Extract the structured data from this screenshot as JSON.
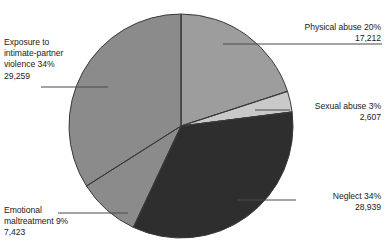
{
  "chart_data": {
    "type": "pie",
    "title": "",
    "subtitle": "",
    "xlabel": "",
    "ylabel": "",
    "legend_position": "callout-labels",
    "grid": false,
    "total": 85440,
    "start_angle_deg": 0,
    "direction": "clockwise",
    "categories": [
      "Physical abuse",
      "Sexual abuse",
      "Neglect",
      "Emotional maltreatment",
      "Exposure to intimate-partner violence"
    ],
    "values": [
      17212,
      2607,
      28939,
      7423,
      29259
    ],
    "percents": [
      20,
      3,
      34,
      9,
      34
    ],
    "colors": [
      "#9d9d9d",
      "#c9c9c9",
      "#2e2e2e",
      "#8b8b8b",
      "#8b8b8b"
    ],
    "slices": [
      {
        "label": "Physical abuse",
        "percent": 20,
        "percent_text": "20%",
        "value": 17212,
        "value_text": "17,212",
        "color": "#9d9d9d",
        "start_deg": 0,
        "sweep_deg": 72
      },
      {
        "label": "Sexual abuse",
        "percent": 3,
        "percent_text": "3%",
        "value": 2607,
        "value_text": "2,607",
        "color": "#c9c9c9",
        "start_deg": 72,
        "sweep_deg": 10.8
      },
      {
        "label": "Neglect",
        "percent": 34,
        "percent_text": "34%",
        "value": 28939,
        "value_text": "28,939",
        "color": "#2e2e2e",
        "start_deg": 82.8,
        "sweep_deg": 122.4
      },
      {
        "label": "Emotional maltreatment",
        "percent": 9,
        "percent_text": "9%",
        "value": 7423,
        "value_text": "7,423",
        "color": "#8b8b8b",
        "start_deg": 205.2,
        "sweep_deg": 32.4
      },
      {
        "label": "Exposure to intimate-partner violence",
        "percent": 34,
        "percent_text": "34%",
        "value": 29259,
        "value_text": "29,259",
        "color": "#8b8b8b",
        "start_deg": 237.6,
        "sweep_deg": 122.4
      }
    ]
  },
  "labels": {
    "physical": "Physical abuse 20%\n17,212",
    "sexual": "Sexual abuse 3%\n2,607",
    "neglect": "Neglect 34%\n28,939",
    "emotional": "Emotional\nmaltreatment 9%\n7,423",
    "exposure": "Exposure to\nintimate-partner\nviolence 34%\n29,259"
  },
  "style": {
    "background": "#ffffff",
    "text_color": "#1b1b1b",
    "slice_outline": "#3a3a3a",
    "leader_line_color": "#4a4a4a"
  }
}
